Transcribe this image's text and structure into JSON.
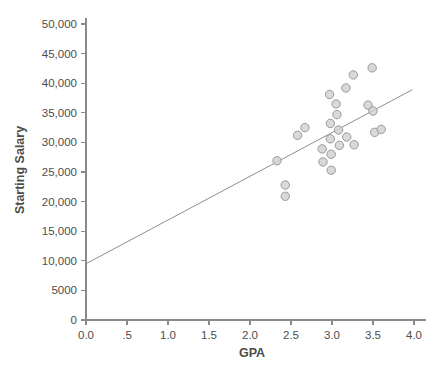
{
  "chart_data": {
    "type": "scatter",
    "title": "",
    "xlabel": "GPA",
    "ylabel": "Starting Salary",
    "xlim": [
      0.0,
      4.0
    ],
    "ylim": [
      0,
      50000
    ],
    "grid": false,
    "legend": null,
    "x_tick_labels": [
      "0.0",
      ".5",
      "1.0",
      "1.5",
      "2.0",
      "2.5",
      "3.0",
      "3.5",
      "4.0"
    ],
    "x_tick_values": [
      0.0,
      0.5,
      1.0,
      1.5,
      2.0,
      2.5,
      3.0,
      3.5,
      4.0
    ],
    "y_tick_labels": [
      "0",
      "5000",
      "10,000",
      "15,000",
      "20,000",
      "25,000",
      "30,000",
      "35,000",
      "40,000",
      "45,000",
      "50,000"
    ],
    "y_tick_values": [
      0,
      5000,
      10000,
      15000,
      20000,
      25000,
      30000,
      35000,
      40000,
      45000,
      50000
    ],
    "marker": {
      "shape": "circle",
      "radius_px": 4.2,
      "fill_color": "#d2d2d2",
      "edge_color": "#9a9a9a"
    },
    "fit_line": {
      "label": "linear fit",
      "color": "#8f8f8f",
      "x_start": 0.0,
      "y_start": 9500,
      "x_end": 3.98,
      "y_end": 38900,
      "slope": 7387,
      "intercept": 9500
    },
    "points": [
      {
        "x": 2.33,
        "y": 26900
      },
      {
        "x": 2.43,
        "y": 22800
      },
      {
        "x": 2.43,
        "y": 20900
      },
      {
        "x": 2.58,
        "y": 31200
      },
      {
        "x": 2.67,
        "y": 32500
      },
      {
        "x": 2.88,
        "y": 28900
      },
      {
        "x": 2.89,
        "y": 26700
      },
      {
        "x": 2.97,
        "y": 38100
      },
      {
        "x": 2.98,
        "y": 33200
      },
      {
        "x": 2.98,
        "y": 30600
      },
      {
        "x": 2.99,
        "y": 28000
      },
      {
        "x": 2.99,
        "y": 25300
      },
      {
        "x": 3.05,
        "y": 36500
      },
      {
        "x": 3.06,
        "y": 34700
      },
      {
        "x": 3.08,
        "y": 32100
      },
      {
        "x": 3.09,
        "y": 29500
      },
      {
        "x": 3.17,
        "y": 39200
      },
      {
        "x": 3.18,
        "y": 30900
      },
      {
        "x": 3.26,
        "y": 41400
      },
      {
        "x": 3.27,
        "y": 29600
      },
      {
        "x": 3.44,
        "y": 36300
      },
      {
        "x": 3.49,
        "y": 42600
      },
      {
        "x": 3.5,
        "y": 35300
      },
      {
        "x": 3.52,
        "y": 31700
      },
      {
        "x": 3.6,
        "y": 32200
      }
    ]
  }
}
